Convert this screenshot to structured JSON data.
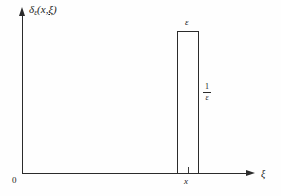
{
  "figure": {
    "background_color": "#fefefe",
    "ink_color": "#2b2b2b"
  },
  "axes": {
    "y_label": "δ",
    "y_label_subscript": "ε",
    "y_label_args": "(x,",
    "y_label_arg_underlined": "ξ",
    "y_label_close": ")",
    "x_label": "ξ",
    "origin_label": "0"
  },
  "annotations": {
    "pulse_width_label": "ε",
    "pulse_height_numerator": "1",
    "pulse_height_denominator": "ε",
    "x_tick_label": "x"
  },
  "chart_data": {
    "type": "area",
    "title": "",
    "xlabel": "ξ",
    "ylabel": "δε(x, ξ)",
    "xlim": [
      0,
      10
    ],
    "ylim": [
      0,
      1.1
    ],
    "grid": false,
    "legend": null,
    "series": [
      {
        "name": "δε(x, ξ)",
        "description": "Rectangular pulse of width ε and height 1/ε centered at ξ = x",
        "x": [
          0,
          6.9,
          6.9,
          7.9,
          7.9,
          10
        ],
        "values": [
          0,
          0,
          1,
          1,
          0,
          0
        ]
      }
    ],
    "annotations": [
      {
        "text": "ε",
        "meaning": "width of pulse",
        "at": "top of rectangle"
      },
      {
        "text": "1/ε",
        "meaning": "height of pulse",
        "at": "right of rectangle"
      },
      {
        "text": "x",
        "meaning": "center location of pulse on ξ axis",
        "at": "x-axis tick"
      },
      {
        "text": "0",
        "meaning": "origin",
        "at": "axis intersection"
      }
    ]
  }
}
